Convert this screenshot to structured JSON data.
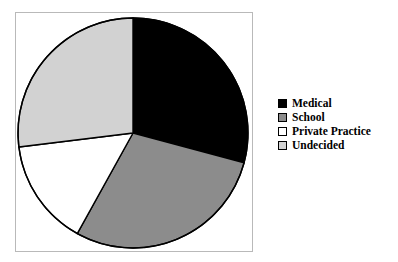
{
  "chart_data": {
    "type": "pie",
    "title": "",
    "subtitle": "",
    "xlabel": "",
    "ylabel": "",
    "grid": false,
    "legend_position": "right",
    "start_angle_deg": 0,
    "direction": "clockwise",
    "categories": [
      "Medical",
      "School",
      "Private Practice",
      "Undecided"
    ],
    "values": [
      29.2,
      28.9,
      15.0,
      26.9
    ],
    "slices": [
      {
        "label": "Medical",
        "value": 29.2,
        "start_deg": 0,
        "end_deg": 105,
        "color": "#000000",
        "border": "#000000"
      },
      {
        "label": "School",
        "value": 28.9,
        "start_deg": 105,
        "end_deg": 209,
        "color": "#8c8c8c",
        "border": "#000000"
      },
      {
        "label": "Private Practice",
        "value": 15.0,
        "start_deg": 209,
        "end_deg": 263,
        "color": "#ffffff",
        "border": "#000000"
      },
      {
        "label": "Undecided",
        "value": 26.9,
        "start_deg": 263,
        "end_deg": 360,
        "color": "#d2d2d2",
        "border": "#000000"
      }
    ],
    "geometry": {
      "cx": 133,
      "cy": 133,
      "r": 115
    },
    "frame_color": "#b9b9b9",
    "background": "#ffffff"
  },
  "legend": {
    "items": [
      {
        "label": "Medical",
        "color": "#000000"
      },
      {
        "label": "School",
        "color": "#8c8c8c"
      },
      {
        "label": "Private Practice",
        "color": "#ffffff"
      },
      {
        "label": "Undecided",
        "color": "#d2d2d2"
      }
    ]
  }
}
